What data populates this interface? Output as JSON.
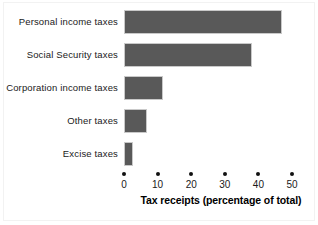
{
  "chart_data": {
    "type": "bar",
    "orientation": "horizontal",
    "title": "",
    "xlabel": "Tax receipts (percentage of total)",
    "ylabel": "",
    "categories": [
      "Personal income taxes",
      "Social Security taxes",
      "Corporation income taxes",
      "Other taxes",
      "Excise taxes"
    ],
    "values": [
      47,
      38,
      11.6,
      6.8,
      2.7
    ],
    "xlim": [
      0,
      50
    ],
    "xticks": [
      0,
      10,
      20,
      30,
      40,
      50
    ],
    "xtick_labels": [
      "0",
      "10",
      "20",
      "30",
      "40",
      "50"
    ],
    "grid": false,
    "legend": null,
    "series": [
      {
        "name": "Tax receipts",
        "values": [
          47,
          38,
          11.6,
          6.8,
          2.7
        ]
      }
    ]
  },
  "style": {
    "bar_color": "#595959",
    "bar_border_color": "#c9c9c9",
    "background_color": "#ffffff",
    "text_color": "#1a1a1a",
    "tick_dot_color": "#111111"
  }
}
